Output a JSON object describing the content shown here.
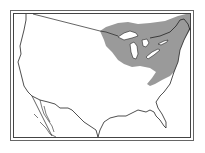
{
  "map": {
    "type": "range-map",
    "region": "United States (contiguous)",
    "highlighted_region": "Great Lakes / Northeast range",
    "colors": {
      "background": "#ffffff",
      "outline": "#222222",
      "range_fill": "#9a9a9a",
      "lakes": "#ffffff",
      "frame": "#555555"
    }
  }
}
